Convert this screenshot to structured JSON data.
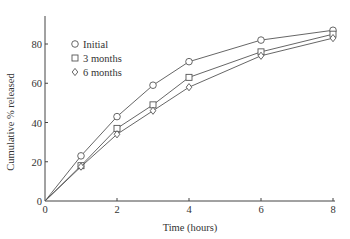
{
  "chart_data": {
    "type": "line",
    "title": "",
    "xlabel": "Time (hours)",
    "ylabel": "Cumulative % released",
    "xlim": [
      0,
      8
    ],
    "ylim": [
      0,
      90
    ],
    "x_ticks": [
      0,
      2,
      4,
      6,
      8
    ],
    "y_ticks": [
      0,
      20,
      40,
      60,
      80
    ],
    "grid": false,
    "legend_position": "upper left",
    "x": [
      0,
      1,
      2,
      3,
      4,
      6,
      8
    ],
    "series": [
      {
        "name": "Initial",
        "marker": "circle",
        "values": [
          0,
          23,
          43,
          59,
          71,
          82,
          87
        ]
      },
      {
        "name": "3 months",
        "marker": "square",
        "values": [
          0,
          18,
          37,
          49,
          63,
          76,
          85
        ]
      },
      {
        "name": "6 months",
        "marker": "diamond",
        "values": [
          0,
          17.5,
          34,
          46,
          58,
          74,
          83
        ]
      }
    ]
  },
  "axes": {
    "x_tick_labels": [
      "0",
      "2",
      "4",
      "6",
      "8"
    ],
    "y_tick_labels": [
      "0",
      "20",
      "40",
      "60",
      "80"
    ],
    "xlabel": "Time (hours)",
    "ylabel": "Cumulative % released"
  },
  "legend": {
    "items": [
      "Initial",
      "3 months",
      "6 months"
    ]
  }
}
